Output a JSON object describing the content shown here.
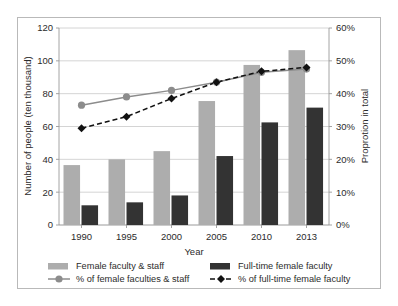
{
  "chart_data": {
    "type": "bar",
    "title": "",
    "subtitle": "",
    "xlabel": "Year",
    "ylabel": "Number of people (ten thousand)",
    "y2label": "Proprotion in total",
    "categories": [
      "1990",
      "1995",
      "2000",
      "2005",
      "2010",
      "2013"
    ],
    "ylim": [
      0,
      120
    ],
    "yticks": [
      "0",
      "20",
      "40",
      "60",
      "80",
      "100",
      "120"
    ],
    "y2lim": [
      0,
      60
    ],
    "y2ticks": [
      "0%",
      "10%",
      "20%",
      "30%",
      "40%",
      "50%",
      "60%"
    ],
    "grid": true,
    "legend_position": "bottom",
    "series": [
      {
        "name": "Female faculty & staff",
        "type": "bar",
        "axis": "left",
        "color": "#adadad",
        "values": [
          36.5,
          40.0,
          45.0,
          75.5,
          97.5,
          106.5
        ]
      },
      {
        "name": "Full-time female faculty",
        "type": "bar",
        "axis": "left",
        "color": "#333333",
        "values": [
          12.0,
          13.8,
          18.0,
          42.0,
          62.5,
          71.5
        ]
      },
      {
        "name": "% of female faculties & staff",
        "type": "line",
        "axis": "right",
        "color": "#8c8c8c",
        "marker": "circle",
        "line_style": "solid",
        "values": [
          36.5,
          39.0,
          41.0,
          43.5,
          46.5,
          47.5
        ]
      },
      {
        "name": "% of full-time female faculty",
        "type": "line",
        "axis": "right",
        "color": "#111111",
        "marker": "diamond",
        "line_style": "dashed",
        "values": [
          29.5,
          33.0,
          38.5,
          43.5,
          46.8,
          48.0
        ]
      }
    ]
  },
  "legend": {
    "items": [
      {
        "label": "Female faculty & staff",
        "swatch": "bar-gray"
      },
      {
        "label": "Full-time female faculty",
        "swatch": "bar-dark"
      },
      {
        "label": "% of female faculties & staff",
        "swatch": "line-circle"
      },
      {
        "label": "% of full-time female faculty",
        "swatch": "line-diamond"
      }
    ]
  }
}
